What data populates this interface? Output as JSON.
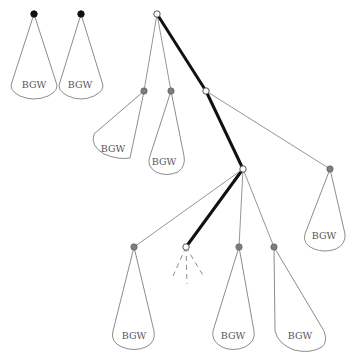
{
  "diagram": {
    "type": "tree",
    "colors": {
      "black_node": "#111111",
      "grey_node": "#7d7d7d",
      "white_node": "#ffffff",
      "thick_path": "#111111",
      "thin_edge": "#7a7a7a"
    },
    "subtree_label": "BGW",
    "nodes": [
      {
        "id": "L1",
        "kind": "black",
        "x": 34,
        "y": 14
      },
      {
        "id": "L2",
        "kind": "black",
        "x": 81,
        "y": 14
      },
      {
        "id": "root",
        "kind": "white",
        "x": 157,
        "y": 14
      },
      {
        "id": "A",
        "kind": "grey",
        "x": 144,
        "y": 91
      },
      {
        "id": "B",
        "kind": "grey",
        "x": 171,
        "y": 91
      },
      {
        "id": "C",
        "kind": "white",
        "x": 206,
        "y": 91
      },
      {
        "id": "D",
        "kind": "white",
        "x": 243,
        "y": 169
      },
      {
        "id": "E",
        "kind": "grey",
        "x": 330,
        "y": 169
      },
      {
        "id": "F",
        "kind": "grey",
        "x": 134,
        "y": 247
      },
      {
        "id": "G",
        "kind": "white",
        "x": 186,
        "y": 247
      },
      {
        "id": "H",
        "kind": "grey",
        "x": 239,
        "y": 247
      },
      {
        "id": "I",
        "kind": "grey",
        "x": 274,
        "y": 247
      }
    ],
    "labels": [
      {
        "id": "bgw-L1",
        "text": "BGW"
      },
      {
        "id": "bgw-L2",
        "text": "BGW"
      },
      {
        "id": "bgw-A",
        "text": "BGW"
      },
      {
        "id": "bgw-B",
        "text": "BGW"
      },
      {
        "id": "bgw-E",
        "text": "BGW"
      },
      {
        "id": "bgw-F",
        "text": "BGW"
      },
      {
        "id": "bgw-H",
        "text": "BGW"
      },
      {
        "id": "bgw-I",
        "text": "BGW"
      }
    ]
  }
}
